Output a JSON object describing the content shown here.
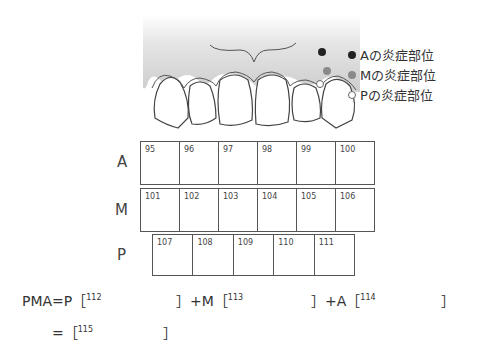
{
  "legend": [
    {
      "label": "Aの炎症部位",
      "marker": "filled-dark-dot",
      "color": "#222222"
    },
    {
      "label": "Mの炎症部位",
      "marker": "filled-gray-dot",
      "color": "#8a8a8a"
    },
    {
      "label": "Pの炎症部位",
      "marker": "open-white-dot",
      "color": "#ffffff"
    }
  ],
  "rows": [
    {
      "label": "A",
      "cells": [
        "95",
        "96",
        "97",
        "98",
        "99",
        "100"
      ]
    },
    {
      "label": "M",
      "cells": [
        "101",
        "102",
        "103",
        "104",
        "105",
        "106"
      ]
    },
    {
      "label": "P",
      "cells": [
        "107",
        "108",
        "109",
        "110",
        "111"
      ]
    }
  ],
  "formula": {
    "line1": {
      "prefix": "PMA=P［",
      "blank1": "112",
      "mid1": "］+M［",
      "blank2": "113",
      "mid2": "］+A［",
      "blank3": "114",
      "end": "］"
    },
    "line2": {
      "prefix": "=［",
      "blank": "115",
      "end": "］"
    }
  },
  "colors": {
    "gum_top": "#ffffff",
    "gum_bottom": "#cfcfcf",
    "outline": "#444444",
    "dot_A": "#222222",
    "dot_M": "#8a8a8a",
    "dot_P": "#ffffff"
  }
}
